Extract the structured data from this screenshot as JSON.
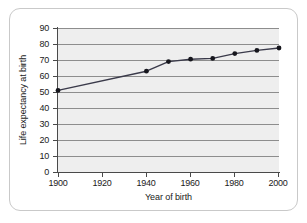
{
  "chart_data": {
    "type": "line",
    "title": "",
    "xlabel": "Year of birth",
    "ylabel": "Life expectancy at birth",
    "xlim": [
      1900,
      2000
    ],
    "ylim": [
      0,
      90
    ],
    "grid": true,
    "legend": false,
    "x_ticks": [
      1900,
      1920,
      1940,
      1960,
      1980,
      2000
    ],
    "y_ticks": [
      0,
      10,
      20,
      30,
      40,
      50,
      60,
      70,
      80,
      90
    ],
    "series": [
      {
        "name": "Life expectancy at birth",
        "color": "#3a3a4a",
        "marker": "circle",
        "x": [
          1900,
          1940,
          1950,
          1960,
          1970,
          1980,
          1990,
          2000
        ],
        "values": [
          51,
          63,
          69,
          70.5,
          71,
          74,
          76,
          77.5
        ]
      }
    ]
  },
  "axes": {
    "y_labels": [
      "90",
      "80",
      "70",
      "60",
      "50",
      "40",
      "30",
      "20",
      "10",
      "0"
    ],
    "x_labels": [
      "1900",
      "1920",
      "1940",
      "1960",
      "1980",
      "2000"
    ],
    "y_title": "Life expectancy at birth",
    "x_title": "Year of birth"
  },
  "style": {
    "plot_background": "#eeeeee",
    "gridline_color": "#8d8d8d",
    "axis_color": "#4a4a4a",
    "series_color": "#3a3a4a",
    "frame_color": "#c9c9c9"
  }
}
